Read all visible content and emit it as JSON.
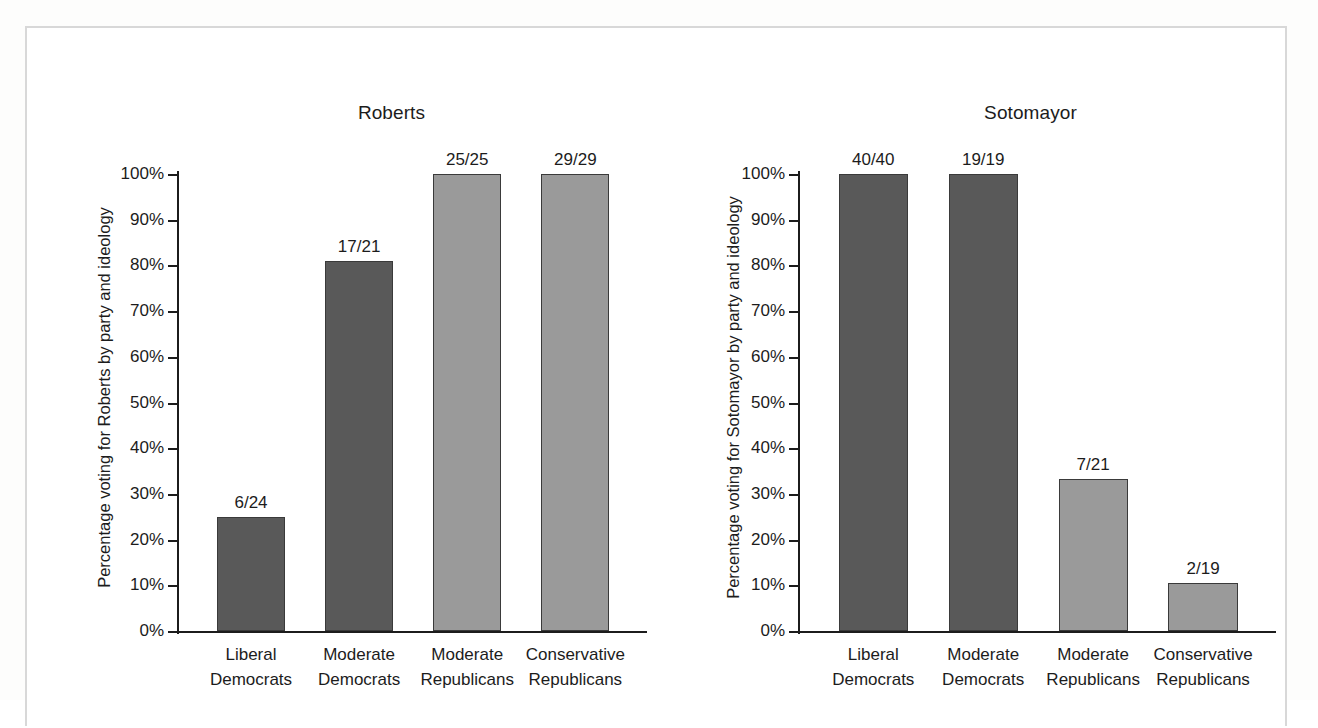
{
  "figure": {
    "background_color": "#ffffff",
    "border_color": "#d8d8d8",
    "panels": [
      "Roberts",
      "Sotomayor"
    ]
  },
  "palette": {
    "democrat_bar": "#595959",
    "republican_bar": "#9a9a9a",
    "bar_outline": "#3a3a3a",
    "axis": "#1c1c1c",
    "text": "#1c1c1c"
  },
  "chart_data": [
    {
      "type": "bar",
      "title": "Roberts",
      "xlabel": "",
      "ylabel": "Percentage voting for Roberts by party and ideology",
      "ylim": [
        0,
        100
      ],
      "grid": false,
      "legend": "none",
      "ytick_labels": [
        "0%",
        "10%",
        "20%",
        "30%",
        "40%",
        "50%",
        "60%",
        "70%",
        "80%",
        "90%",
        "100%"
      ],
      "ytick_values": [
        0,
        10,
        20,
        30,
        40,
        50,
        60,
        70,
        80,
        90,
        100
      ],
      "categories": [
        {
          "line1": "Liberal",
          "line2": "Democrats"
        },
        {
          "line1": "Moderate",
          "line2": "Democrats"
        },
        {
          "line1": "Moderate",
          "line2": "Republicans"
        },
        {
          "line1": "Conservative",
          "line2": "Republicans"
        }
      ],
      "values": [
        25.0,
        81.0,
        100.0,
        100.0
      ],
      "data_labels": [
        "6/24",
        "17/21",
        "25/25",
        "29/29"
      ],
      "bar_colors": [
        "#595959",
        "#595959",
        "#9a9a9a",
        "#9a9a9a"
      ]
    },
    {
      "type": "bar",
      "title": "Sotomayor",
      "xlabel": "",
      "ylabel": "Percentage voting for Sotomayor by party and ideology",
      "ylim": [
        0,
        100
      ],
      "grid": false,
      "legend": "none",
      "ytick_labels": [
        "0%",
        "10%",
        "20%",
        "30%",
        "40%",
        "50%",
        "60%",
        "70%",
        "80%",
        "90%",
        "100%"
      ],
      "ytick_values": [
        0,
        10,
        20,
        30,
        40,
        50,
        60,
        70,
        80,
        90,
        100
      ],
      "categories": [
        {
          "line1": "Liberal",
          "line2": "Democrats"
        },
        {
          "line1": "Moderate",
          "line2": "Democrats"
        },
        {
          "line1": "Moderate",
          "line2": "Republicans"
        },
        {
          "line1": "Conservative",
          "line2": "Republicans"
        }
      ],
      "values": [
        100.0,
        100.0,
        33.3,
        10.5
      ],
      "data_labels": [
        "40/40",
        "19/19",
        "7/21",
        "2/19"
      ],
      "bar_colors": [
        "#595959",
        "#595959",
        "#9a9a9a",
        "#9a9a9a"
      ]
    }
  ]
}
